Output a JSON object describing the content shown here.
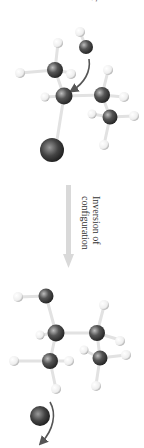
{
  "figure": {
    "orientation": "rotated-90-clockwise",
    "top_partial_text": "r",
    "reaction_arrow_label_line1": "Inversion of",
    "reaction_arrow_label_line2": "configuration",
    "colors": {
      "carbon": "#4a4a4a",
      "hydrogen": "#f4f4f4",
      "halogen_leaving_group": "#3a3a3a",
      "nucleophile_oxygen": "#4d4d4d",
      "bond": "#e6e6e6",
      "curved_arrow": "#555555",
      "reaction_arrow": "#d6d6d6",
      "text": "#333333"
    }
  }
}
